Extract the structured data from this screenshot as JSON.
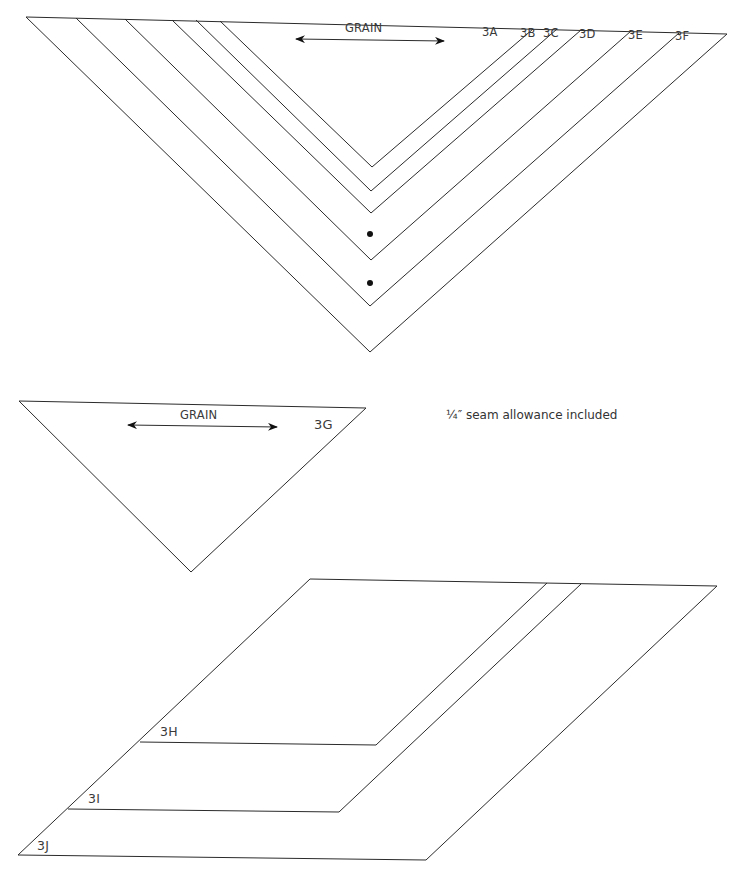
{
  "top_pattern": {
    "grain_label": "GRAIN",
    "pieces": [
      {
        "label": "3A"
      },
      {
        "label": "3B"
      },
      {
        "label": "3C"
      },
      {
        "label": "3D"
      },
      {
        "label": "3E"
      },
      {
        "label": "3F"
      }
    ],
    "marks": [
      "dot",
      "dot"
    ]
  },
  "middle_pattern": {
    "grain_label": "GRAIN",
    "piece_label": "3G",
    "note": "¼″ seam allowance included"
  },
  "bottom_pattern": {
    "pieces": [
      {
        "label": "3H"
      },
      {
        "label": "3I"
      },
      {
        "label": "3J"
      }
    ]
  },
  "icons": {
    "grain_arrow": "double-headed-arrow-icon",
    "match_point": "dot-marker-icon"
  }
}
